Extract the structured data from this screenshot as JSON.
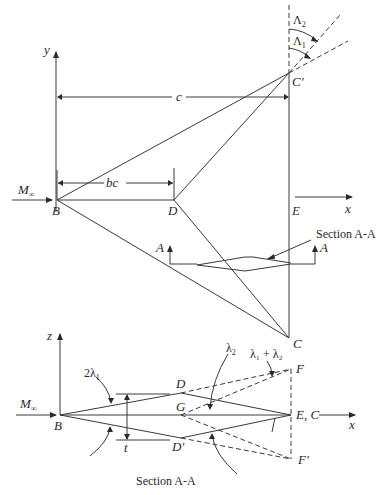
{
  "top_view": {
    "axis_y": "y",
    "axis_x": "x",
    "freestream": "M",
    "freestream_sub": "∞",
    "dim_c": "c",
    "dim_bc": "bc",
    "points": {
      "B": "B",
      "D": "D",
      "E": "E",
      "C": "C",
      "C_prime": "C′",
      "A_left": "A",
      "A_right": "A"
    },
    "sweep_labels": {
      "lambda1": "Λ",
      "lambda1_sub": "1",
      "lambda2": "Λ",
      "lambda2_sub": "2"
    },
    "section_label": "Section A-A"
  },
  "section_view": {
    "axis_z": "z",
    "axis_x": "x",
    "freestream": "M",
    "freestream_sub": "∞",
    "points": {
      "B": "B",
      "D": "D",
      "G": "G",
      "D_prime": "D′",
      "EC": "E, C",
      "F": "F",
      "F_prime": "F′"
    },
    "angle_2lambda1": "2λ",
    "angle_2lambda1_sub": "1",
    "angle_lambda2": "λ",
    "angle_lambda2_sub": "2",
    "angle_sum": "λ₁ + λ₂",
    "thickness": "t",
    "caption": "Section A-A"
  }
}
